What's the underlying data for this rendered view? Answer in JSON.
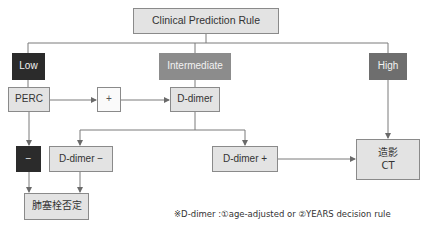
{
  "diagram": {
    "title": "Clinical Prediction Rule",
    "risk_levels": {
      "low": "Low",
      "intermediate": "Intermediate",
      "high": "High"
    },
    "nodes": {
      "perc": "PERC",
      "perc_positive": "+",
      "d_dimer": "D-dimer",
      "perc_negative": "−",
      "d_dimer_negative": "D-dimer −",
      "d_dimer_positive": "D-dimer +",
      "ct_line1": "造影",
      "ct_line2": "CT",
      "pe_excluded": "肺塞栓否定"
    },
    "footnote": "※D-dimer :①age-adjusted or ②YEARS decision rule",
    "colors": {
      "low": "#2b2b2b",
      "intermediate": "#8c8c8c",
      "high": "#6e6e6e",
      "node_fill": "#e3e3e3",
      "line": "#7a7a7a"
    }
  }
}
